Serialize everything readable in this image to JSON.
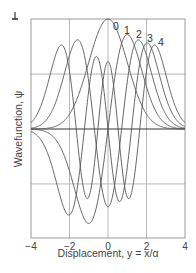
{
  "chart_data": {
    "type": "line",
    "title": "",
    "xlabel": "Displacement, y = x/α",
    "ylabel": "Wavefunction, ψ",
    "xlim": [
      -4,
      4
    ],
    "ylim": [
      -0.744,
      0.751
    ],
    "x_ticks": [
      -4,
      -2,
      0,
      2,
      4
    ],
    "x_tick_labels": [
      "−4",
      "−2",
      "0",
      "2",
      "4"
    ],
    "y_gridlines": [
      -0.375,
      0,
      0.375
    ],
    "grid": true,
    "legend": "inline curve labels at top right",
    "curve_labels": [
      "0",
      "1",
      "2",
      "3",
      "4"
    ],
    "series": [
      {
        "name": "0",
        "formula": "psi_0(y) = pi^-1/4 * exp(-y^2/2)",
        "peak": [
          0,
          0.751
        ]
      },
      {
        "name": "1",
        "formula": "psi_1(y) = pi^-1/4 * sqrt(2) * y * exp(-y^2/2)",
        "peak": [
          1.0,
          0.644
        ]
      },
      {
        "name": "2",
        "formula": "psi_2(y) = pi^-1/4 * (2y^2-1)/sqrt(2) * exp(-y^2/2)",
        "peak": [
          1.73,
          0.594
        ]
      },
      {
        "name": "3",
        "formula": "psi_3(y) = pi^-1/4 * (2y^3-3y)/sqrt(3) * exp(-y^2/2)",
        "peak": [
          2.35,
          0.56
        ]
      },
      {
        "name": "4",
        "formula": "psi_4(y) = pi^-1/4 * (4y^4-12y^2+3)/(2*sqrt(6)) * exp(-y^2/2)",
        "peak": [
          2.76,
          0.535
        ]
      }
    ],
    "sample_x": [
      -4,
      -3,
      -2,
      -1,
      0,
      1,
      2,
      3,
      4
    ]
  },
  "scale_marker": "1",
  "colors": {
    "curve": "#555555",
    "grid": "#b8b8b8",
    "frame": "#9a9a9a",
    "zero_line": "#333333"
  }
}
